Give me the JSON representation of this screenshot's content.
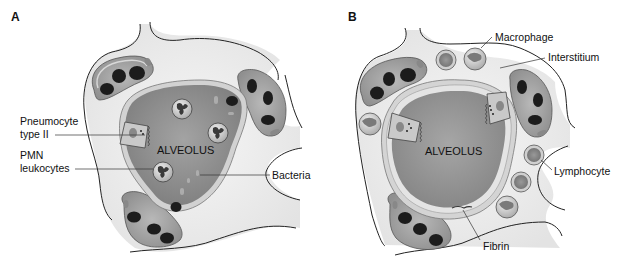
{
  "figure": {
    "panels": [
      {
        "id": "A",
        "label": "A",
        "center_label": "ALVEOLUS",
        "callouts": [
          {
            "id": "pneumocyte",
            "lines": [
              "Pneumocyte",
              "type II"
            ]
          },
          {
            "id": "pmn",
            "lines": [
              "PMN",
              "leukocytes"
            ]
          },
          {
            "id": "bacteria",
            "lines": [
              "Bacteria"
            ]
          }
        ]
      },
      {
        "id": "B",
        "label": "B",
        "center_label": "ALVEOLUS",
        "callouts": [
          {
            "id": "macrophage",
            "lines": [
              "Macrophage"
            ]
          },
          {
            "id": "interstitium",
            "lines": [
              "Interstitium"
            ]
          },
          {
            "id": "lymphocyte",
            "lines": [
              "Lymphocyte"
            ]
          },
          {
            "id": "fibrin",
            "lines": [
              "Fibrin"
            ]
          }
        ]
      }
    ],
    "colors": {
      "background": "#ffffff",
      "interstitium": "#eeeeee",
      "alveolus_fill": "#8e8e8e",
      "alveolus_wall": "#cfcfcf",
      "capillary_fill": "#a8a8a8",
      "capillary_wall": "#d6d6d6",
      "rbc": "#1c1c1c",
      "leukocyte": "#e6e6e6",
      "nucleus": "#555555",
      "outline": "#222222"
    }
  }
}
